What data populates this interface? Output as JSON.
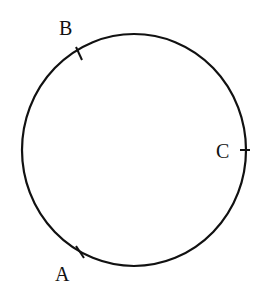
{
  "diagram": {
    "type": "circle-with-marked-points",
    "circle": {
      "cx": 134,
      "cy": 150,
      "rx": 112,
      "ry": 116,
      "stroke": "#111111",
      "stroke_width": 2.2
    },
    "points": [
      {
        "label": "A",
        "tick": {
          "x1": 76,
          "y1": 246,
          "x2": 84,
          "y2": 258
        },
        "label_pos": {
          "left": 55,
          "top": 264
        }
      },
      {
        "label": "B",
        "tick": {
          "x1": 76,
          "y1": 47,
          "x2": 82,
          "y2": 60
        },
        "label_pos": {
          "left": 59,
          "top": 18
        }
      },
      {
        "label": "C",
        "tick": {
          "x1": 240,
          "y1": 150,
          "x2": 250,
          "y2": 150
        },
        "label_pos": {
          "left": 216,
          "top": 141
        }
      }
    ]
  }
}
